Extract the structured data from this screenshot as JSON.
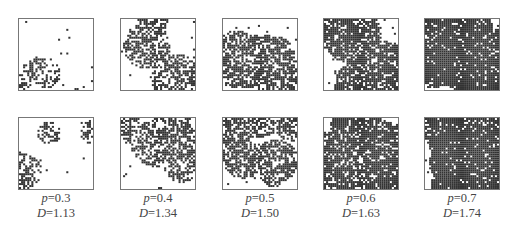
{
  "figure": {
    "rows": 2,
    "columns": [
      {
        "p_label": "p",
        "p_value": "=0.3",
        "D_label": "D",
        "D_value": "=1.13",
        "density": 0.1
      },
      {
        "p_label": "p",
        "p_value": "=0.4",
        "D_label": "D",
        "D_value": "=1.34",
        "density": 0.2
      },
      {
        "p_label": "p",
        "p_value": "=0.5",
        "D_label": "D",
        "D_value": "=1.50",
        "density": 0.3
      },
      {
        "p_label": "p",
        "p_value": "=0.6",
        "D_label": "D",
        "D_value": "=1.63",
        "density": 0.45
      },
      {
        "p_label": "p",
        "p_value": "=0.7",
        "D_label": "D",
        "D_value": "=1.74",
        "density": 0.55
      }
    ]
  },
  "colors": {
    "ink": "#333333",
    "border": "#777777",
    "background": "#ffffff"
  }
}
